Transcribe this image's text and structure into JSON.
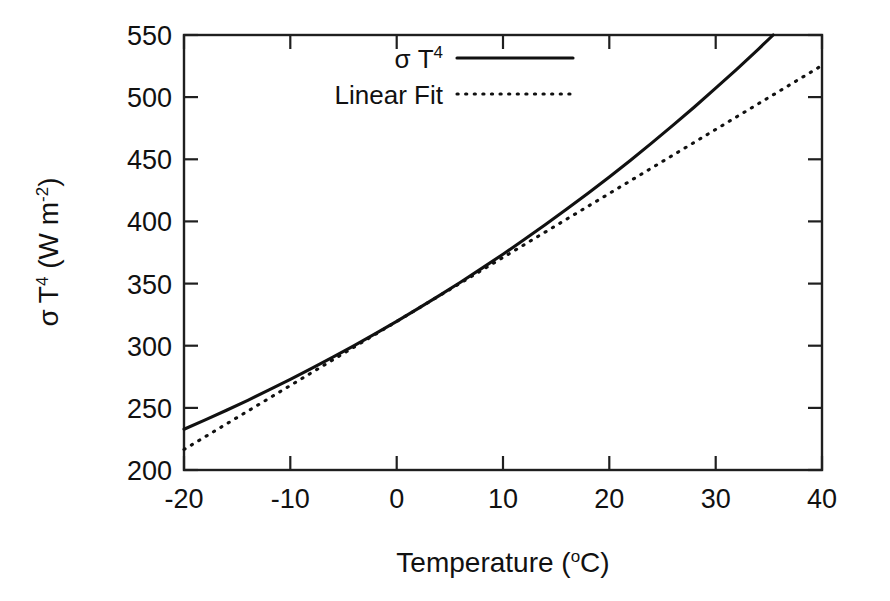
{
  "figure": {
    "background": "#ffffff",
    "ink_color": "#111111"
  },
  "chart_data": {
    "type": "line",
    "title": "",
    "subtitle": "",
    "xlabel": "Temperature (oC)",
    "xlabel_parts": {
      "base": "Temperature (",
      "sup": "o",
      "tail": "C)"
    },
    "ylabel": "sigma T4 (W m-2)",
    "ylabel_parts": {
      "sigma": "σ",
      "t": "T",
      "t_sup": "4",
      "unit_open": " (W m",
      "unit_sup": "-2",
      "unit_close": ")"
    },
    "xlim": [
      -20,
      40
    ],
    "ylim": [
      200,
      550
    ],
    "xticks": [
      -20,
      -10,
      0,
      10,
      20,
      30,
      40
    ],
    "xtick_labels": [
      "-20",
      "-10",
      "0",
      "10",
      "20",
      "30",
      "40"
    ],
    "yticks": [
      200,
      250,
      300,
      350,
      400,
      450,
      500,
      550
    ],
    "ytick_labels": [
      "200",
      "250",
      "300",
      "350",
      "400",
      "450",
      "500",
      "550"
    ],
    "grid": false,
    "legend_position": "top-center",
    "legend_entries": [
      {
        "label": "σ T4",
        "label_base": "σ T",
        "label_sup": "4",
        "style": "solid"
      },
      {
        "label": "Linear Fit",
        "label_base": "Linear Fit",
        "label_sup": "",
        "style": "dotted"
      }
    ],
    "x": [
      -20,
      -18,
      -16,
      -14,
      -12,
      -10,
      -8,
      -6,
      -4,
      -2,
      0,
      2,
      4,
      6,
      8,
      10,
      12,
      14,
      16,
      18,
      20,
      22,
      24,
      26,
      28,
      30,
      32,
      34,
      36,
      38,
      40
    ],
    "series": [
      {
        "name": "σ T4",
        "style": "solid",
        "values": [
          232.8,
          240.3,
          248.1,
          256.1,
          264.4,
          272.9,
          281.7,
          290.8,
          300.1,
          309.7,
          319.6,
          329.8,
          340.3,
          351.1,
          362.2,
          373.6,
          385.4,
          397.5,
          409.9,
          422.7,
          435.8,
          449.3,
          463.2,
          477.5,
          492.1,
          507.2,
          522.6,
          538.5,
          554.8,
          571.5,
          588.7
        ]
      },
      {
        "name": "Linear Fit",
        "style": "dotted",
        "values": [
          216.5,
          226.8,
          237.1,
          247.4,
          257.7,
          268.0,
          278.3,
          288.6,
          298.9,
          309.2,
          319.5,
          329.8,
          340.1,
          350.4,
          360.7,
          371.0,
          381.3,
          391.6,
          401.9,
          412.2,
          422.5,
          432.8,
          443.1,
          453.4,
          463.7,
          474.0,
          484.3,
          494.6,
          504.9,
          515.2,
          525.5
        ]
      }
    ],
    "notes": {
      "curve_endpoints": {
        "solid_at_-20": 233,
        "solid_at_40": 545,
        "dotted_at_-20": 217,
        "dotted_at_40": 526
      },
      "crossings_approx": [
        -3,
        26
      ]
    }
  }
}
